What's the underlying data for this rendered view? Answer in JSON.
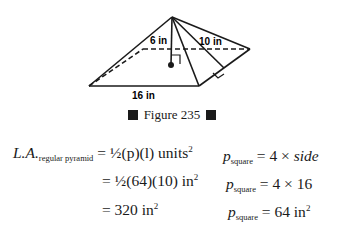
{
  "figure": {
    "labels": {
      "slant_edge": "6 in",
      "slant_height": "10 in",
      "base_side": "16 in"
    },
    "caption": "Figure 235"
  },
  "equations": {
    "left": {
      "lhs_main": "L.A.",
      "lhs_sub": "regular pyramid",
      "line1": "= ½(p)(l) units",
      "line2": "= ½(64)(10) in",
      "line3": "= 320 in",
      "exp": "2"
    },
    "right": {
      "var": "p",
      "sub": "square",
      "line1": "= 4 × ",
      "line1_italic": "side",
      "line2": "= 4 × 16",
      "line3": "= 64 in",
      "exp": "2"
    }
  }
}
